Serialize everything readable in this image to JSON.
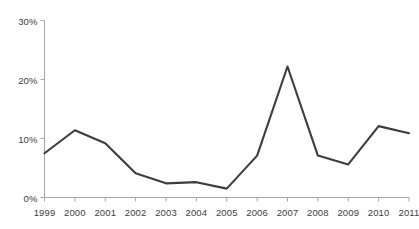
{
  "chart_data": {
    "type": "line",
    "title": "",
    "xlabel": "",
    "ylabel": "",
    "categories": [
      "1999",
      "2000",
      "2001",
      "2002",
      "2003",
      "2004",
      "2005",
      "2006",
      "2007",
      "2008",
      "2009",
      "2010",
      "2011"
    ],
    "values": [
      7.5,
      11.4,
      9.2,
      4.1,
      2.4,
      2.6,
      1.5,
      7.1,
      22.2,
      7.1,
      5.6,
      12.1,
      10.9
    ],
    "series": [
      {
        "name": "",
        "values": [
          7.5,
          11.4,
          9.2,
          4.1,
          2.4,
          2.6,
          1.5,
          7.1,
          22.2,
          7.1,
          5.6,
          12.1,
          10.9
        ]
      }
    ],
    "ylim": [
      0,
      30
    ],
    "y_ticks": [
      0,
      10,
      20,
      30
    ],
    "y_tick_labels": [
      "0%",
      "10%",
      "20%",
      "30%"
    ],
    "x_tick_labels": [
      "1999",
      "2000",
      "2001",
      "2002",
      "2003",
      "2004",
      "2005",
      "2006",
      "2007",
      "2008",
      "2009",
      "2010",
      "2011"
    ],
    "grid": false,
    "legend": false,
    "legend_position": "none",
    "line_color": "#3d3d3d",
    "axis_color": "#a6a6a6",
    "background_color": "#ffffff"
  }
}
